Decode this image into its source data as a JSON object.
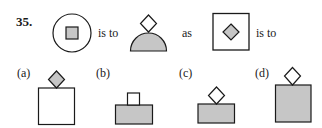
{
  "question": {
    "number": "35.",
    "connectors": {
      "is_to_1": "is to",
      "as": "as",
      "is_to_2": "is to"
    },
    "figures": [
      {
        "id": "circle-with-square",
        "description": "circle containing a small gray square"
      },
      {
        "id": "diamond-on-semicircle",
        "description": "white diamond on top of a gray semicircle"
      },
      {
        "id": "square-with-diamond",
        "description": "square containing a gray diamond"
      }
    ],
    "options": [
      {
        "label": "(a)",
        "description": "gray diamond on top of a white square"
      },
      {
        "label": "(b)",
        "description": "small white square on top of a gray rectangle"
      },
      {
        "label": "(c)",
        "description": "white diamond on top of a gray rectangle"
      },
      {
        "label": "(d)",
        "description": "white diamond on top of a gray square"
      }
    ]
  },
  "colors": {
    "fill_gray": "#c6c6c6",
    "stroke": "#1a1a1a",
    "background": "#ffffff"
  }
}
